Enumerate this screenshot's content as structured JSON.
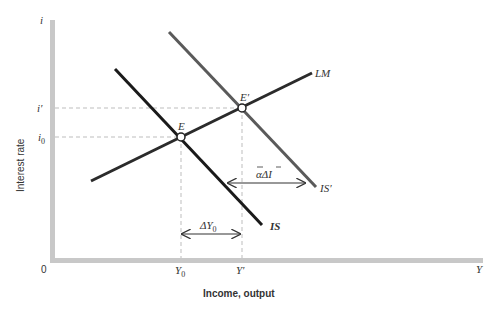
{
  "figure": {
    "type": "IS-LM diagram",
    "y_axis": {
      "label": "Interest rate",
      "symbol": "i",
      "ticks": [
        "i'",
        "i0"
      ]
    },
    "x_axis": {
      "label": "Income, output",
      "symbol": "Y",
      "origin": "0",
      "ticks": [
        "Y0",
        "Y'"
      ]
    },
    "curves": [
      {
        "name": "LM",
        "label": "LM",
        "color": "#2b2b2b"
      },
      {
        "name": "IS",
        "label": "IS",
        "color": "#1a1a1a"
      },
      {
        "name": "IS'",
        "label": "IS'",
        "color": "#555555"
      }
    ],
    "points": [
      {
        "name": "E",
        "label": "E"
      },
      {
        "name": "E'",
        "label": "E'"
      }
    ],
    "annotations": [
      {
        "name": "shift",
        "label": "ᾱΔĪ"
      },
      {
        "name": "delta-y0",
        "label": "ΔY0"
      }
    ],
    "colors": {
      "axis": "#c8c8c8",
      "dashed": "#bdbdbd",
      "text": "#333333"
    }
  },
  "labels": {
    "i": "i",
    "i_prime": "i′",
    "i0_main": "i",
    "i0_sub": "0",
    "zero": "0",
    "Y": "Y",
    "Y0_main": "Y",
    "Y0_sub": "0",
    "Y_prime": "Y′",
    "ylabel": "Interest rate",
    "xlabel": "Income, output",
    "LM": "LM",
    "IS": "IS",
    "IS_prime": "IS′",
    "E": "E",
    "E_prime": "E′",
    "shift_main": "αΔI",
    "dY_main": "ΔY",
    "dY_sub": "0"
  }
}
